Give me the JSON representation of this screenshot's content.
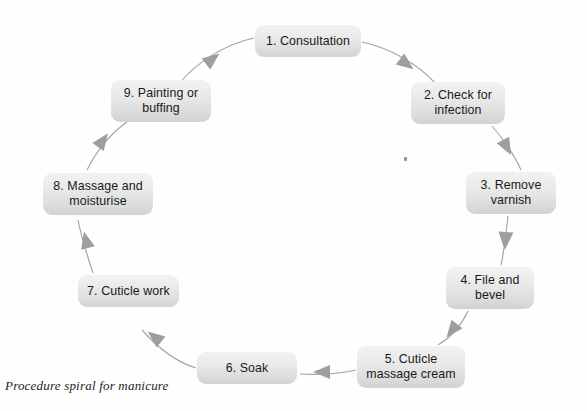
{
  "diagram": {
    "title_caption": "Procedure spiral for manicure",
    "shape": "clockwise cycle",
    "colors": {
      "node_fill_top": "#f2f2f2",
      "node_fill_bottom": "#d2d2d2",
      "node_text": "#1a1a1a",
      "arrow": "#9a9a9a",
      "arrowhead": "#9e9e9e",
      "background": "#fefefe",
      "caption_text": "#232323"
    },
    "nodes": [
      {
        "id": "step-1",
        "label": "1. Consultation",
        "x": 255,
        "y": 25,
        "w": 106,
        "h": 32
      },
      {
        "id": "step-2",
        "label": "2. Check for\ninfection",
        "x": 411,
        "y": 82,
        "w": 94,
        "h": 42
      },
      {
        "id": "step-3",
        "label": "3. Remove\nvarnish",
        "x": 466,
        "y": 172,
        "w": 90,
        "h": 42
      },
      {
        "id": "step-4",
        "label": "4. File and\nbevel",
        "x": 446,
        "y": 267,
        "w": 88,
        "h": 42
      },
      {
        "id": "step-5",
        "label": "5. Cuticle\nmassage cream",
        "x": 357,
        "y": 346,
        "w": 108,
        "h": 42
      },
      {
        "id": "step-6",
        "label": "6. Soak",
        "x": 197,
        "y": 352,
        "w": 100,
        "h": 32
      },
      {
        "id": "step-7",
        "label": "7. Cuticle work",
        "x": 78,
        "y": 275,
        "w": 101,
        "h": 32
      },
      {
        "id": "step-8",
        "label": "8. Massage and\nmoisturise",
        "x": 43,
        "y": 173,
        "w": 110,
        "h": 42
      },
      {
        "id": "step-9",
        "label": "9. Painting or\nbuffing",
        "x": 111,
        "y": 80,
        "w": 100,
        "h": 42
      }
    ],
    "edges": [
      {
        "id": "edge-1-2",
        "from": "step-1",
        "to": "step-2"
      },
      {
        "id": "edge-2-3",
        "from": "step-2",
        "to": "step-3"
      },
      {
        "id": "edge-3-4",
        "from": "step-3",
        "to": "step-4"
      },
      {
        "id": "edge-4-5",
        "from": "step-4",
        "to": "step-5"
      },
      {
        "id": "edge-5-6",
        "from": "step-5",
        "to": "step-6"
      },
      {
        "id": "edge-6-7",
        "from": "step-6",
        "to": "step-7"
      },
      {
        "id": "edge-7-8",
        "from": "step-7",
        "to": "step-8"
      },
      {
        "id": "edge-8-9",
        "from": "step-8",
        "to": "step-9"
      },
      {
        "id": "edge-9-1",
        "from": "step-9",
        "to": "step-1"
      }
    ]
  }
}
